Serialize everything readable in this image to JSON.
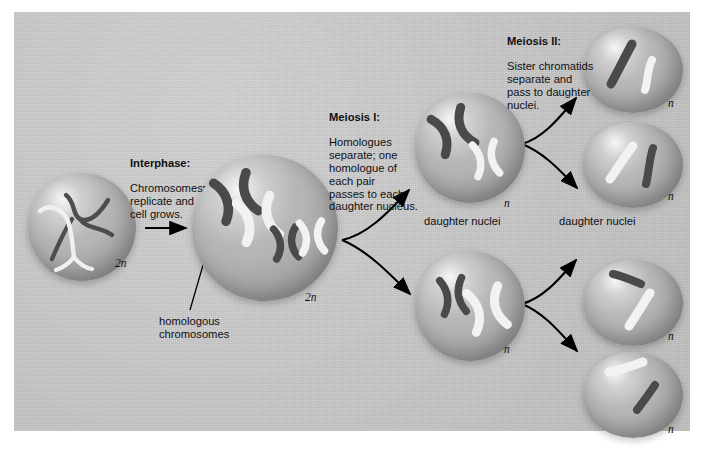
{
  "figure": {
    "background_color": "#c9c9c9",
    "border_color": "#ffffff"
  },
  "labels": {
    "interphase": {
      "heading": "Interphase:",
      "body": "Chromosomes\nreplicate and\ncell grows."
    },
    "meiosis_i": {
      "heading": "Meiosis I:",
      "body": "Homologues\nseparate; one\nhomologue of\neach pair\npasses to each\ndaughter nucleus."
    },
    "meiosis_ii": {
      "heading": "Meiosis II:",
      "body": "Sister chromatids\nseparate and\npass to daughter\nnuclei."
    },
    "homologous_chromosomes": "homologous\nchromosomes",
    "daughter_nuclei_1": "daughter nuclei",
    "daughter_nuclei_2": "daughter nuclei"
  },
  "ploidy": {
    "parent_interphase": "2n",
    "parent_condensed": "2n",
    "daughter_top": "n",
    "daughter_bottom": "n",
    "final_1": "n",
    "final_2": "n",
    "final_3": "n",
    "final_4": "n"
  },
  "cells": [
    {
      "name": "interphase-cell",
      "ploidy": "2n",
      "stage": "interphase",
      "chromosome_form": "threadlike-uncondensed",
      "chromosomes": [
        {
          "color": "dark",
          "size": "large"
        },
        {
          "color": "white",
          "size": "large"
        },
        {
          "color": "dark",
          "size": "small"
        },
        {
          "color": "white",
          "size": "small"
        }
      ]
    },
    {
      "name": "condensed-parent-cell",
      "ploidy": "2n",
      "stage": "prophase-I",
      "chromosome_form": "duplicated-X",
      "chromosomes": [
        {
          "color": "dark",
          "size": "large"
        },
        {
          "color": "white",
          "size": "large"
        },
        {
          "color": "dark",
          "size": "small"
        },
        {
          "color": "white",
          "size": "small"
        }
      ]
    },
    {
      "name": "daughter-nucleus-top",
      "ploidy": "n",
      "stage": "after-meiosis-I",
      "chromosome_form": "duplicated-X",
      "chromosomes": [
        {
          "color": "dark",
          "size": "large"
        },
        {
          "color": "white",
          "size": "small"
        }
      ]
    },
    {
      "name": "daughter-nucleus-bottom",
      "ploidy": "n",
      "stage": "after-meiosis-I",
      "chromosome_form": "duplicated-X",
      "chromosomes": [
        {
          "color": "dark",
          "size": "small"
        },
        {
          "color": "white",
          "size": "large"
        }
      ]
    },
    {
      "name": "final-nucleus-1",
      "ploidy": "n",
      "stage": "after-meiosis-II",
      "chromosome_form": "single-chromatid",
      "chromosomes": [
        {
          "color": "dark",
          "size": "large"
        },
        {
          "color": "white",
          "size": "small"
        }
      ]
    },
    {
      "name": "final-nucleus-2",
      "ploidy": "n",
      "stage": "after-meiosis-II",
      "chromosome_form": "single-chromatid",
      "chromosomes": [
        {
          "color": "white",
          "size": "large"
        },
        {
          "color": "dark",
          "size": "small"
        }
      ]
    },
    {
      "name": "final-nucleus-3",
      "ploidy": "n",
      "stage": "after-meiosis-II",
      "chromosome_form": "single-chromatid",
      "chromosomes": [
        {
          "color": "dark",
          "size": "small"
        },
        {
          "color": "white",
          "size": "large"
        }
      ]
    },
    {
      "name": "final-nucleus-4",
      "ploidy": "n",
      "stage": "after-meiosis-II",
      "chromosome_form": "single-chromatid",
      "chromosomes": [
        {
          "color": "white",
          "size": "large"
        },
        {
          "color": "dark",
          "size": "small"
        }
      ]
    }
  ],
  "colors": {
    "chromosome_dark": "#4a4a4a",
    "chromosome_white": "#f2f2f2",
    "cell_fill": "#b0b0b0",
    "arrow": "#000000",
    "text": "#111111"
  }
}
